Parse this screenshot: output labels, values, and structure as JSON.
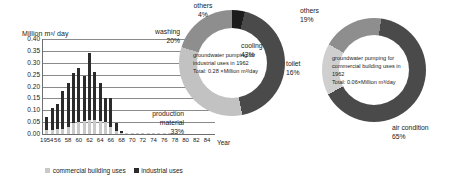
{
  "chart_data": [
    {
      "type": "bar",
      "title": "",
      "ylabel": "Million m³/ day",
      "xlabel": "Year",
      "ylim": [
        0,
        0.4
      ],
      "yticks": [
        "0.00",
        "0.05",
        "0.10",
        "0.15",
        "0.20",
        "0.25",
        "0.30",
        "0.35",
        "0.40"
      ],
      "ytick_values": [
        0.0,
        0.05,
        0.1,
        0.15,
        0.2,
        0.25,
        0.3,
        0.35,
        0.4
      ],
      "grid": true,
      "legend_position": "bottom",
      "stacked": true,
      "categories": [
        1954,
        1955,
        1956,
        1957,
        1958,
        1959,
        1960,
        1961,
        1962,
        1963,
        1964,
        1965,
        1966,
        1967,
        1968,
        1969,
        1970,
        1971,
        1972,
        1973,
        1974,
        1975,
        1976,
        1977,
        1978,
        1979,
        1980,
        1981,
        1982,
        1983,
        1984
      ],
      "xtick_labels": [
        "1954",
        "56",
        "58",
        "60",
        "62",
        "64",
        "66",
        "68",
        "70",
        "72",
        "74",
        "76",
        "78",
        "80",
        "82",
        "84"
      ],
      "xtick_values": [
        1954,
        1956,
        1958,
        1960,
        1962,
        1964,
        1966,
        1968,
        1970,
        1972,
        1974,
        1976,
        1978,
        1980,
        1982,
        1984
      ],
      "series": [
        {
          "name": "commercial building uses",
          "color": "#c9c9c9",
          "values": [
            0.015,
            0.018,
            0.02,
            0.022,
            0.03,
            0.045,
            0.05,
            0.055,
            0.058,
            0.06,
            0.055,
            0.05,
            0.03,
            0.012,
            0.005,
            0.003,
            0.002,
            0.001,
            0.001,
            0.001,
            0.001,
            0.001,
            0.001,
            0.001,
            0.0,
            0.0,
            0.0,
            0.0,
            0.0,
            0.0,
            0.0
          ]
        },
        {
          "name": "industrial uses",
          "color": "#2b2b2b",
          "values": [
            0.058,
            0.092,
            0.108,
            0.158,
            0.185,
            0.21,
            0.23,
            0.19,
            0.282,
            0.2,
            0.16,
            0.1,
            0.12,
            0.033,
            0.008,
            0.003,
            0.002,
            0.002,
            0.002,
            0.001,
            0.001,
            0.001,
            0.001,
            0.001,
            0.0,
            0.0,
            0.0,
            0.0,
            0.0,
            0.0,
            0.0
          ]
        }
      ],
      "totals": [
        0.073,
        0.11,
        0.128,
        0.18,
        0.215,
        0.255,
        0.28,
        0.245,
        0.34,
        0.26,
        0.215,
        0.15,
        0.15,
        0.045,
        0.013,
        0.006,
        0.004,
        0.003,
        0.003,
        0.002,
        0.002,
        0.002,
        0.002,
        0.002,
        0.0,
        0.0,
        0.0,
        0.0,
        0.0,
        0.0,
        0.0
      ]
    },
    {
      "type": "pie",
      "variant": "donut",
      "title": "groundwater pumping for industrial uses in 1962",
      "center_lines": [
        "groundwater pumping for",
        "industrial uses in 1962",
        "Total: 0.28 ×Million m³/day"
      ],
      "labels": [
        "cooling",
        "production material",
        "washing",
        "others"
      ],
      "values": [
        43,
        33,
        20,
        4
      ],
      "value_labels": [
        "43%",
        "33%",
        "20%",
        "4%"
      ],
      "colors": [
        "#4a4a4a",
        "#c2c2c2",
        "#8e8e8e",
        "#1c1c1c"
      ]
    },
    {
      "type": "pie",
      "variant": "donut",
      "title": "groundwater pumping for commercial building uses in 1962",
      "center_lines": [
        "groundwater pumping  for",
        "commercial building uses in",
        "1962",
        "Total: 0.06×Million m³/day"
      ],
      "labels": [
        "air condition",
        "toilet",
        "others"
      ],
      "values": [
        65,
        16,
        19
      ],
      "value_labels": [
        "65%",
        "16%",
        "19%"
      ],
      "colors": [
        "#4a4a4a",
        "#cfcfcf",
        "#8e8e8e"
      ]
    }
  ],
  "bar_chart": {
    "y_axis_title": "Million m³/ day",
    "x_axis_title": "Year",
    "legend": [
      {
        "label": "commercial building uses"
      },
      {
        "label": "industrial uses"
      }
    ]
  },
  "donut_left": {
    "center_line_1": "groundwater pumping for",
    "center_line_2": "industrial uses in 1962",
    "center_line_3": "Total: 0.28 ×Million m³/day",
    "label_others": "others",
    "pct_others": "4%",
    "label_cooling": "cooling",
    "pct_cooling": "43%",
    "label_washing": "washing",
    "pct_washing": "20%",
    "label_production_1": "production",
    "label_production_2": "material",
    "pct_production": "33%"
  },
  "donut_right": {
    "center_line_1": "groundwater pumping  for",
    "center_line_2": "commercial building uses in",
    "center_line_3": "1962",
    "center_line_4": "Total: 0.06×Million m³/day",
    "label_others": "others",
    "pct_others": "19%",
    "label_toilet": "toilet",
    "pct_toilet": "16%",
    "label_air": "air condition",
    "pct_air": "65%"
  }
}
